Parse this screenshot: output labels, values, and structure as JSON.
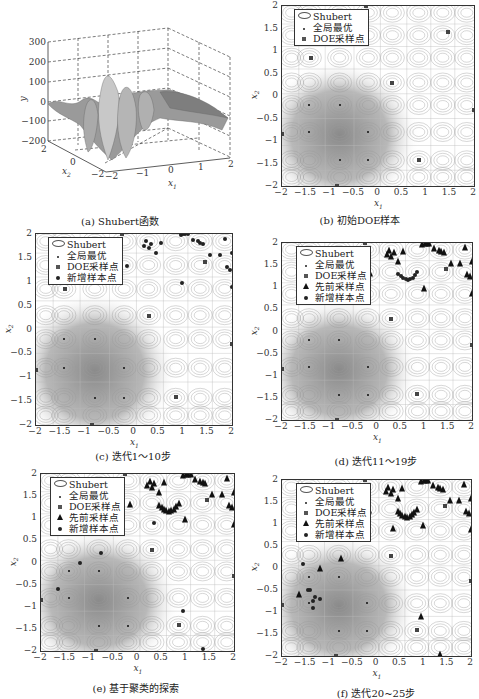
{
  "figure": {
    "panels": [
      {
        "id": "a",
        "caption": "(a) Shubert函数",
        "type": "surface3d",
        "zlabel": "y",
        "xlabel": "x1",
        "ylabel": "x2",
        "zticks": [
          "300",
          "200",
          "100",
          "0",
          "−100",
          "−200"
        ],
        "x1ticks": [
          "−2",
          "−1",
          "0",
          "1",
          "2"
        ],
        "x2ticks": [
          "2",
          "0",
          "−2"
        ]
      },
      {
        "id": "b",
        "caption": "(b) 初始DOE样本",
        "type": "contour",
        "legend": [
          "Shubert",
          "全局最优",
          "DOE采样点"
        ]
      },
      {
        "id": "c",
        "caption": "(c) 迭代1～10步",
        "type": "contour",
        "legend": [
          "Shubert",
          "全局最优",
          "DOE采样点",
          "新增样本点"
        ]
      },
      {
        "id": "d",
        "caption": "(d) 迭代11～19步",
        "type": "contour",
        "legend": [
          "Shubert",
          "全局最优",
          "DOE采样点",
          "先前采样点",
          "新增样本点"
        ]
      },
      {
        "id": "e",
        "caption": "(e) 基于聚类的探索",
        "type": "contour",
        "legend": [
          "Shubert",
          "全局最优",
          "DOE采样点",
          "先前采样点",
          "新增样本点"
        ]
      },
      {
        "id": "f",
        "caption": "(f) 迭代20~25步",
        "type": "contour",
        "legend": [
          "Shubert",
          "全局最优",
          "DOE采样点",
          "先前采样点",
          "新增样本点"
        ]
      }
    ],
    "axes": {
      "xlabel": "x1",
      "ylabel": "x2",
      "xticks": [
        "−2",
        "−1.5",
        "−1",
        "−0.5",
        "0",
        "0.5",
        "1",
        "1.5",
        "2"
      ],
      "yticks": [
        "2",
        "1.5",
        "1",
        "0.5",
        "0",
        "−0.5",
        "−1",
        "−1.5",
        "−2"
      ]
    }
  },
  "chart_data": [
    {
      "type": "surface",
      "title": "(a) Shubert函数",
      "xlabel": "x1",
      "ylabel": "x2",
      "zlabel": "y",
      "xlim": [
        -2,
        2
      ],
      "ylim": [
        -2,
        2
      ],
      "zlim": [
        -200,
        300
      ],
      "zticks": [
        300,
        200,
        100,
        0,
        -100,
        -200
      ],
      "grid": true
    },
    {
      "type": "scatter",
      "title": "(b) 初始DOE样本",
      "xlabel": "x1",
      "ylabel": "x2",
      "xlim": [
        -2,
        2
      ],
      "ylim": [
        -2,
        2
      ],
      "legend": [
        "Shubert",
        "全局最优",
        "DOE采样点"
      ],
      "series": [
        {
          "name": "全局最优",
          "x": [
            -1.43,
            -0.8,
            -1.43,
            -0.8
          ],
          "y": [
            -0.8,
            -1.43,
            -0.8,
            -1.43
          ]
        },
        {
          "name": "DOE采样点",
          "x": [
            -1.4,
            -0.25,
            0.3,
            1.45,
            0.85,
            -2.0,
            -0.85,
            2.0
          ],
          "y": [
            0.85,
            2.0,
            0.28,
            1.42,
            -1.42,
            -0.85,
            -2.0,
            -0.3
          ]
        }
      ]
    },
    {
      "type": "scatter",
      "title": "(c) 迭代1～10步",
      "xlabel": "x1",
      "ylabel": "x2",
      "xlim": [
        -2,
        2
      ],
      "ylim": [
        -2,
        2
      ],
      "legend": [
        "Shubert",
        "全局最优",
        "DOE采样点",
        "新增样本点"
      ],
      "series": [
        {
          "name": "DOE采样点",
          "x": [
            -1.4,
            -0.25,
            0.3,
            1.45,
            0.85,
            -2.0,
            -0.85,
            2.0
          ],
          "y": [
            0.85,
            2.0,
            0.28,
            1.42,
            -1.42,
            -0.85,
            -2.0,
            -0.3
          ]
        },
        {
          "name": "新增样本点",
          "x": [
            0.2,
            0.25,
            0.3,
            0.35,
            0.45,
            0.55,
            0.95,
            1.0,
            1.05,
            1.1,
            1.2,
            1.3,
            1.35,
            1.4,
            1.55,
            1.75,
            1.85,
            1.9,
            1.95,
            2.0,
            2.0,
            -0.15,
            0.98
          ],
          "y": [
            1.75,
            1.85,
            1.7,
            1.8,
            1.6,
            1.82,
            1.98,
            2.0,
            2.0,
            2.0,
            1.88,
            1.85,
            1.82,
            1.8,
            1.55,
            1.55,
            1.9,
            1.3,
            1.25,
            1.6,
            0.88,
            1.32,
            0.98
          ]
        }
      ]
    },
    {
      "type": "scatter",
      "title": "(d) 迭代11～19步",
      "xlabel": "x1",
      "ylabel": "x2",
      "xlim": [
        -2,
        2
      ],
      "ylim": [
        -2,
        2
      ],
      "legend": [
        "Shubert",
        "全局最优",
        "DOE采样点",
        "先前采样点",
        "新增样本点"
      ],
      "series": [
        {
          "name": "先前采样点",
          "x": [
            0.2,
            0.25,
            0.3,
            0.35,
            0.45,
            0.55,
            0.95,
            1.0,
            1.05,
            1.1,
            1.2,
            1.3,
            1.35,
            1.4,
            1.55,
            1.75,
            1.85,
            1.9,
            1.95,
            2.0,
            2.0,
            -0.15,
            0.98
          ],
          "y": [
            1.75,
            1.85,
            1.7,
            1.8,
            1.6,
            1.82,
            1.98,
            2.0,
            2.0,
            2.0,
            1.88,
            1.85,
            1.82,
            1.8,
            1.55,
            1.55,
            1.9,
            1.3,
            1.25,
            1.6,
            0.88,
            1.32,
            0.98
          ]
        },
        {
          "name": "新增样本点",
          "x": [
            0.45,
            0.5,
            0.55,
            0.6,
            0.65,
            0.7,
            0.75,
            0.8,
            0.85
          ],
          "y": [
            1.3,
            1.25,
            1.2,
            1.18,
            1.17,
            1.18,
            1.22,
            1.28,
            1.35
          ]
        }
      ]
    },
    {
      "type": "scatter",
      "title": "(e) 基于聚类的探索",
      "xlabel": "x1",
      "ylabel": "x2",
      "xlim": [
        -2,
        2
      ],
      "ylim": [
        -2,
        2
      ],
      "legend": [
        "Shubert",
        "全局最优",
        "DOE采样点",
        "先前采样点",
        "新增样本点"
      ],
      "series": [
        {
          "name": "新增样本点",
          "x": [
            0.35,
            -0.75,
            -1.2,
            -1.65,
            0.95,
            1.35
          ],
          "y": [
            0.9,
            0.22,
            0.0,
            -0.6,
            -1.1,
            -1.95
          ]
        }
      ]
    },
    {
      "type": "scatter",
      "title": "(f) 迭代20~25步",
      "xlabel": "x1",
      "ylabel": "x2",
      "xlim": [
        -2,
        2
      ],
      "ylim": [
        -2,
        2
      ],
      "legend": [
        "Shubert",
        "全局最优",
        "DOE采样点",
        "先前采样点",
        "新增样本点"
      ],
      "series": [
        {
          "name": "新增样本点",
          "x": [
            -1.55,
            -1.45,
            -1.4,
            -1.35,
            -1.3,
            -1.2,
            -1.35
          ],
          "y": [
            0.1,
            -0.5,
            -0.5,
            -0.75,
            -0.65,
            -0.7,
            -0.9
          ]
        }
      ]
    }
  ]
}
